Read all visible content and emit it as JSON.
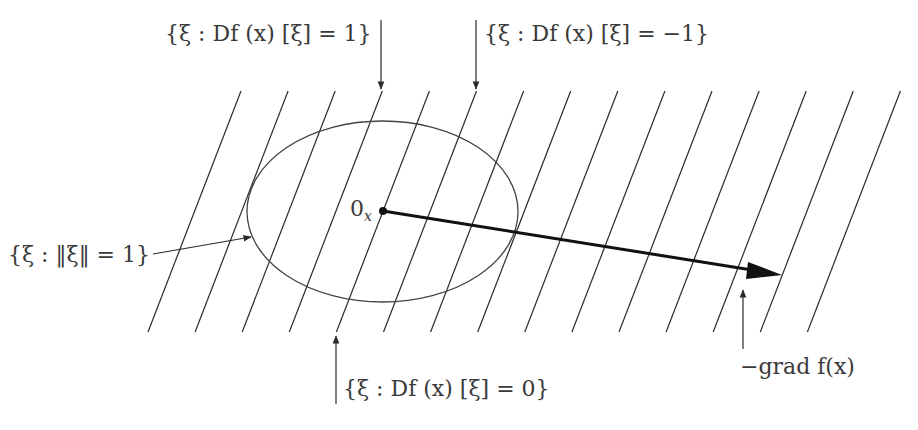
{
  "diagram": {
    "colors": {
      "lines": "#2a2a2a",
      "ellipse": "#444444",
      "arrow": "#111111",
      "text": "#3a3a3a",
      "background": "#ffffff"
    },
    "hatch_lines": {
      "count": 15,
      "bottom_y": 332,
      "top_y": 91,
      "bottom_x_start": 148,
      "spacing": 47.1,
      "dx": 93
    },
    "ellipse": {
      "cx": 382.5,
      "cy": 211.5,
      "rx": 135.5,
      "ry": 90.5
    },
    "origin": {
      "x": 383,
      "y": 211,
      "label_main": "0",
      "label_sub": "x"
    },
    "gradient_arrow": {
      "x1": 383,
      "y1": 211,
      "x2": 782,
      "y2": 275
    },
    "labels": {
      "level_plus_one": "{ξ : Df (x) [ξ] = 1}",
      "level_minus_one": "{ξ : Df (x) [ξ] = −1}",
      "level_zero": "{ξ : Df (x) [ξ] = 0}",
      "unit_sphere": "{ξ : ‖ξ‖ = 1}",
      "neg_gradient": "−grad f(x)"
    }
  }
}
